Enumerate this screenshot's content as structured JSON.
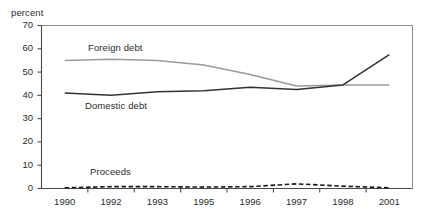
{
  "chart_data": {
    "type": "line",
    "title": "",
    "xlabel": "",
    "ylabel": "percent",
    "ylim": [
      0,
      70
    ],
    "yticks": [
      0,
      10,
      20,
      30,
      40,
      50,
      60,
      70
    ],
    "grid": false,
    "legend_position": "inline-labels",
    "categories": [
      "1990",
      "1992",
      "1993",
      "1995",
      "1996",
      "1997",
      "1998",
      "2001"
    ],
    "series": [
      {
        "name": "Foreign debt",
        "color": "#9a9a9a",
        "style": "solid",
        "values": [
          55,
          55.5,
          55,
          53,
          49,
          44,
          44.5,
          44.5
        ]
      },
      {
        "name": "Domestic debt",
        "color": "#333333",
        "style": "solid",
        "values": [
          41,
          40,
          41.5,
          42,
          43.5,
          42.5,
          44.5,
          57.5
        ]
      },
      {
        "name": "Proceeds",
        "color": "#1a1a1a",
        "style": "dashed",
        "values": [
          0.3,
          0.8,
          0.8,
          0.6,
          0.8,
          2.0,
          1.0,
          0.3
        ]
      }
    ]
  },
  "axis": {
    "y_title": "percent",
    "y_tick_labels": [
      "70",
      "60",
      "50",
      "40",
      "30",
      "20",
      "10",
      "0"
    ],
    "x_tick_labels": [
      "1990",
      "1992",
      "1993",
      "1995",
      "1996",
      "1997",
      "1998",
      "2001"
    ]
  },
  "annotations": {
    "foreign_debt_label": "Foreign debt",
    "domestic_debt_label": "Domestic debt",
    "proceeds_label": "Proceeds"
  },
  "colors": {
    "foreign_debt": "#9a9a9a",
    "domestic_debt": "#333333",
    "proceeds": "#1a1a1a",
    "frame": "#8c8c8c",
    "axis": "#4a4a4a"
  }
}
